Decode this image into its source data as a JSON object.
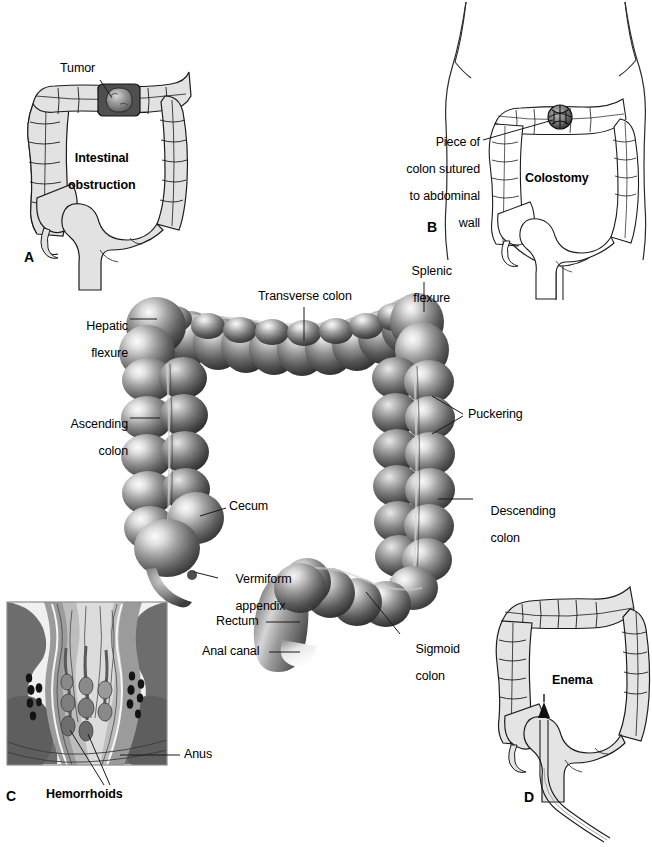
{
  "figure": {
    "background": "#ffffff",
    "width": 652,
    "height": 847
  },
  "palette": {
    "ink": "#000000",
    "line_art_stroke": "#1a1a1a",
    "line_art_fill": "#e2e2e2",
    "colon_dark": "#3e3e3e",
    "colon_mid": "#7d7d7d",
    "colon_light": "#d8d8d8",
    "colon_highlight": "#f2f2f2",
    "tumor_dark": "#4a4a4a",
    "tumor_mid": "#8c8c8c",
    "tissue_dark": "#6e6e6e",
    "tissue_mid": "#9a9a9a",
    "tissue_light": "#cccccc",
    "tissue_pale": "#efefef",
    "body_outline": "#2b2b2b"
  },
  "panels": [
    {
      "id": "A",
      "letter": "A",
      "letter_pos": {
        "x": 24,
        "y": 249
      },
      "caption": "Intestinal obstruction",
      "caption_lines": [
        "Intestinal",
        "obstruction"
      ],
      "caption_pos": {
        "x": 80,
        "y": 138
      },
      "labels": [
        {
          "name": "tumor",
          "text": "Tumor",
          "lines": [
            "Tumor"
          ],
          "pos": {
            "x": 60,
            "y": 62
          },
          "align": "left",
          "leader": {
            "from": [
              100,
              80
            ],
            "to": [
              112,
              98
            ]
          }
        }
      ]
    },
    {
      "id": "B",
      "letter": "B",
      "letter_pos": {
        "x": 427,
        "y": 219
      },
      "caption": "Colostomy",
      "caption_lines": [
        "Colostomy"
      ],
      "caption_pos": {
        "x": 525,
        "y": 172
      },
      "labels": [
        {
          "name": "colon-sutured-to-abdominal-wall",
          "text": "Piece of colon sutured to abdominal wall",
          "lines": [
            "Piece of",
            "colon sutured",
            "to abdominal",
            "wall"
          ],
          "pos": {
            "x": 394,
            "y": 123
          },
          "align": "right",
          "leader": {
            "from": [
              483,
              140
            ],
            "to": [
              553,
              120
            ]
          }
        }
      ]
    },
    {
      "id": "main",
      "letter": "",
      "caption": "",
      "labels": [
        {
          "name": "splenic-flexure",
          "text": "Splenic flexure",
          "lines": [
            "Splenic",
            "flexure"
          ],
          "pos": {
            "x": 400,
            "y": 252
          },
          "align": "left",
          "leader": {
            "from": [
              424,
              282
            ],
            "to": [
              424,
              312
            ]
          }
        },
        {
          "name": "transverse-colon",
          "text": "Transverse colon",
          "lines": [
            "Transverse colon"
          ],
          "pos": {
            "x": 258,
            "y": 290
          },
          "align": "left",
          "leader": {
            "from": [
              304,
              307
            ],
            "to": [
              304,
              341
            ]
          }
        },
        {
          "name": "hepatic-flexure",
          "text": "Hepatic flexure",
          "lines": [
            "Hepatic",
            "flexure"
          ],
          "pos": {
            "x": 74,
            "y": 306
          },
          "align": "right",
          "leader": {
            "from": [
              130,
              319
            ],
            "to": [
              157,
              319
            ]
          }
        },
        {
          "name": "ascending-colon",
          "text": "Ascending colon",
          "lines": [
            "Ascending",
            "colon"
          ],
          "pos": {
            "x": 58,
            "y": 404
          },
          "align": "right",
          "leader": {
            "from": [
              130,
              418
            ],
            "to": [
              160,
              418
            ]
          }
        },
        {
          "name": "puckering",
          "text": "Puckering",
          "lines": [
            "Puckering"
          ],
          "pos": {
            "x": 468,
            "y": 408
          },
          "align": "left",
          "leader": {
            "from": [
              463,
              414
            ],
            "to": [
              432,
              396
            ]
          },
          "leader2": {
            "from": [
              463,
              416
            ],
            "to": [
              432,
              434
            ]
          }
        },
        {
          "name": "cecum",
          "text": "Cecum",
          "lines": [
            "Cecum"
          ],
          "pos": {
            "x": 229,
            "y": 500
          },
          "align": "left",
          "leader": {
            "from": [
              226,
              508
            ],
            "to": [
              200,
              516
            ]
          }
        },
        {
          "name": "descending-colon",
          "text": "Descending colon",
          "lines": [
            "Descending",
            "colon"
          ],
          "pos": {
            "x": 477,
            "y": 491
          },
          "align": "left",
          "leader": {
            "from": [
              473,
              499
            ],
            "to": [
              438,
              499
            ]
          }
        },
        {
          "name": "vermiform-appendix",
          "text": "Vermiform appendix",
          "lines": [
            "Vermiform",
            "appendix"
          ],
          "pos": {
            "x": 222,
            "y": 559
          },
          "align": "left",
          "leader": {
            "from": [
              218,
              578
            ],
            "to": [
              194,
              572
            ]
          }
        },
        {
          "name": "rectum",
          "text": "Rectum",
          "lines": [
            "Rectum"
          ],
          "pos": {
            "x": 216,
            "y": 615
          },
          "align": "left",
          "leader": {
            "from": [
              266,
              622
            ],
            "to": [
              300,
              622
            ]
          }
        },
        {
          "name": "sigmoid-colon",
          "text": "Sigmoid colon",
          "lines": [
            "Sigmoid",
            "colon"
          ],
          "pos": {
            "x": 402,
            "y": 629
          },
          "align": "left",
          "leader": {
            "from": [
              400,
              634
            ],
            "to": [
              366,
              592
            ]
          }
        },
        {
          "name": "anal-canal",
          "text": "Anal canal",
          "lines": [
            "Anal canal"
          ],
          "pos": {
            "x": 202,
            "y": 645
          },
          "align": "left",
          "leader": {
            "from": [
              269,
              652
            ],
            "to": [
              300,
              652
            ]
          }
        }
      ]
    },
    {
      "id": "C",
      "letter": "C",
      "letter_pos": {
        "x": 6,
        "y": 789
      },
      "caption": "Hemorrhoids",
      "caption_lines": [
        "Hemorrhoids"
      ],
      "caption_pos": {
        "x": 46,
        "y": 790
      },
      "labels": [
        {
          "name": "anus",
          "text": "Anus",
          "lines": [
            "Anus"
          ],
          "pos": {
            "x": 184,
            "y": 748
          },
          "align": "left",
          "leader": {
            "from": [
              180,
              755
            ],
            "to": [
              120,
              755
            ]
          }
        }
      ]
    },
    {
      "id": "D",
      "letter": "D",
      "letter_pos": {
        "x": 524,
        "y": 790
      },
      "caption": "Enema",
      "caption_lines": [
        "Enema"
      ],
      "caption_pos": {
        "x": 552,
        "y": 675
      },
      "labels": []
    }
  ]
}
